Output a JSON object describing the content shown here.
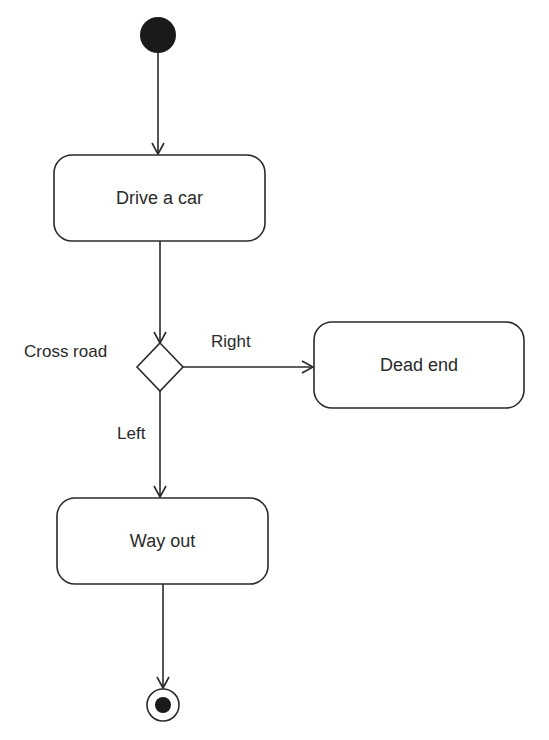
{
  "diagram": {
    "type": "UML activity diagram",
    "nodes": {
      "start": {
        "kind": "initial"
      },
      "drive": {
        "label": "Drive a car"
      },
      "decision": {
        "label": "Cross road"
      },
      "dead_end": {
        "label": "Dead end"
      },
      "way_out": {
        "label": "Way out"
      },
      "end": {
        "kind": "final"
      }
    },
    "edges": {
      "right": {
        "label": "Right"
      },
      "left": {
        "label": "Left"
      }
    },
    "colors": {
      "stroke": "#2a2a2a",
      "fill": "#ffffff",
      "text": "#2a2a2a"
    }
  }
}
